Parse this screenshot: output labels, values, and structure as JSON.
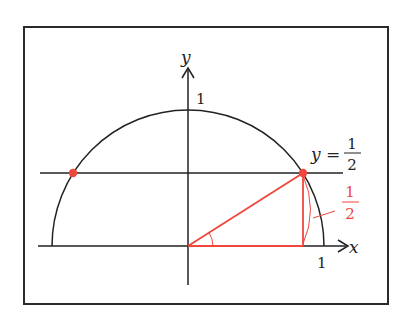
{
  "diagram": {
    "title": "",
    "colors": {
      "ink": "#222222",
      "accent": "#f0463c",
      "frame": "#2a2a2a",
      "background": "#ffffff"
    },
    "axes": {
      "x_label": "x",
      "y_label": "y",
      "x_tick_label": "1",
      "y_tick_label": "1"
    },
    "curve": {
      "name": "upper unit semicircle",
      "label": ""
    },
    "line": {
      "equation_lhs": "y =",
      "numerator": "1",
      "denominator": "2"
    },
    "triangle": {
      "height_label_numerator": "1",
      "height_label_denominator": "2"
    },
    "points": [
      {
        "name": "left-intersection",
        "x": "-√3/2",
        "y": "1/2"
      },
      {
        "name": "right-intersection",
        "x": "√3/2",
        "y": "1/2"
      }
    ]
  }
}
